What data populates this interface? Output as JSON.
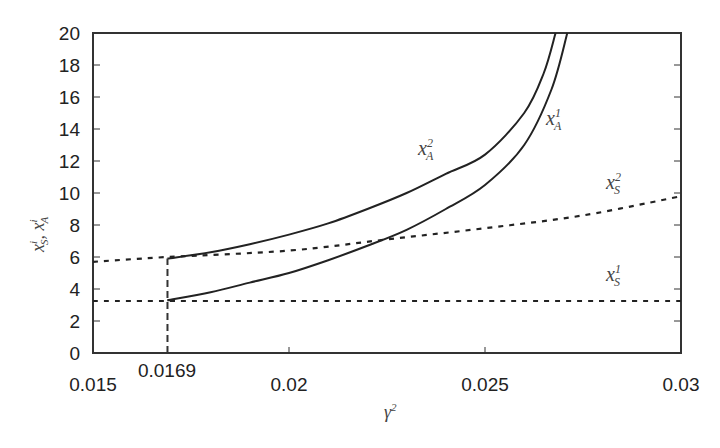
{
  "chart_data": {
    "type": "line",
    "title": "",
    "xlabel": "γ²",
    "ylabel": "x_S^i, x_A^i",
    "xlim": [
      0.015,
      0.03
    ],
    "ylim": [
      0,
      20
    ],
    "grid": false,
    "legend": "inline labels",
    "x_ticks": [
      "0.015",
      "0.02",
      "0.025",
      "0.03"
    ],
    "y_ticks": [
      "0",
      "2",
      "4",
      "6",
      "8",
      "10",
      "12",
      "14",
      "16",
      "18",
      "20"
    ],
    "annotations": [
      {
        "text": "0.0169",
        "x": 0.0169,
        "note": "dashed vertical marker from y=0 to start of curves"
      }
    ],
    "series": [
      {
        "name": "x_A^2",
        "style": "solid",
        "x": [
          0.0169,
          0.018,
          0.019,
          0.02,
          0.021,
          0.022,
          0.023,
          0.024,
          0.025,
          0.026,
          0.0265,
          0.0268
        ],
        "y": [
          5.9,
          6.3,
          6.8,
          7.4,
          8.1,
          9.0,
          10.0,
          11.2,
          12.4,
          15.0,
          17.5,
          20.0
        ]
      },
      {
        "name": "x_A^1",
        "style": "solid",
        "x": [
          0.0169,
          0.018,
          0.019,
          0.02,
          0.021,
          0.022,
          0.023,
          0.024,
          0.025,
          0.026,
          0.0267,
          0.0271
        ],
        "y": [
          3.3,
          3.8,
          4.4,
          5.0,
          5.8,
          6.7,
          7.7,
          9.0,
          10.5,
          13.0,
          16.5,
          20.0
        ]
      },
      {
        "name": "x_S^2",
        "style": "dotted",
        "x": [
          0.015,
          0.0169,
          0.02,
          0.0225,
          0.025,
          0.0275,
          0.03
        ],
        "y": [
          5.7,
          6.0,
          6.4,
          7.1,
          7.8,
          8.6,
          9.8
        ]
      },
      {
        "name": "x_S^1",
        "style": "dotted",
        "x": [
          0.015,
          0.03
        ],
        "y": [
          3.25,
          3.25
        ]
      }
    ],
    "labels": {
      "xA2": {
        "base": "x",
        "sup": "2",
        "sub": "A"
      },
      "xA1": {
        "base": "x",
        "sup": "1",
        "sub": "A"
      },
      "xS2": {
        "base": "x",
        "sup": "2",
        "sub": "S"
      },
      "xS1": {
        "base": "x",
        "sup": "1",
        "sub": "S"
      },
      "xaxis": {
        "base": "γ",
        "sup": "2"
      },
      "yaxis": {
        "part1": "x",
        "sup1": "i",
        "sub1": "S",
        "sep": ", ",
        "part2": "x",
        "sup2": "i",
        "sub2": "A"
      }
    },
    "marker_label": "0.0169"
  }
}
